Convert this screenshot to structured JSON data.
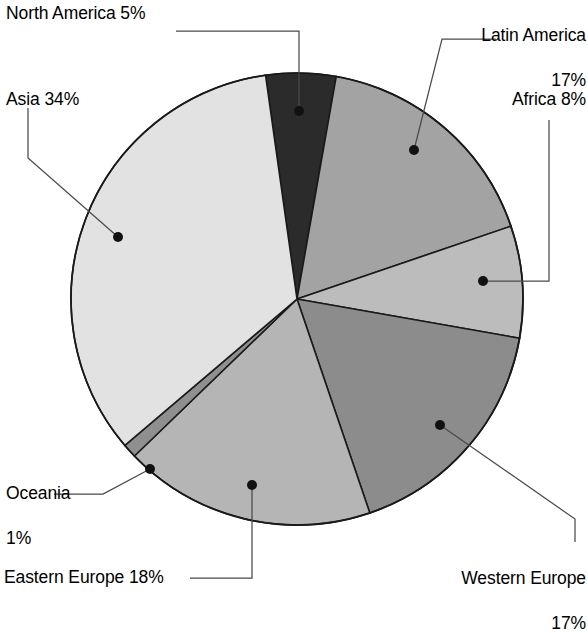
{
  "chart_data": {
    "type": "pie",
    "title": "",
    "subtitle": "",
    "xlabel": "",
    "ylabel": "",
    "legend_position": "none",
    "grid": false,
    "units": "%",
    "total": 100,
    "start_angle_deg": -8,
    "direction": "clockwise",
    "categories": [
      "North America",
      "Latin America",
      "Africa",
      "Western Europe",
      "Eastern Europe",
      "Oceania",
      "Asia"
    ],
    "values": [
      5,
      17,
      8,
      17,
      18,
      1,
      34
    ],
    "slices": [
      {
        "name": "North America",
        "value": 5,
        "label": "North America 5%",
        "value_label": "5%",
        "color": "#2b2b2b",
        "leader": "elbow-left"
      },
      {
        "name": "Latin America",
        "value": 17,
        "label": "Latin America 17%",
        "value_label": "17%",
        "color": "#a3a3a3",
        "leader": "diagonal-right"
      },
      {
        "name": "Africa",
        "value": 8,
        "label": "Africa 8%",
        "value_label": "8%",
        "color": "#bcbcbc",
        "leader": "elbow-right"
      },
      {
        "name": "Western Europe",
        "value": 17,
        "label": "Western Europe 17%",
        "value_label": "17%",
        "color": "#8c8c8c",
        "leader": "elbow-right-down"
      },
      {
        "name": "Eastern Europe",
        "value": 18,
        "label": "Eastern Europe 18%",
        "value_label": "18%",
        "color": "#b5b5b5",
        "leader": "elbow-left-down"
      },
      {
        "name": "Oceania",
        "value": 1,
        "label": "Oceania 1%",
        "value_label": "1%",
        "color": "#8f8f8f",
        "leader": "elbow-left"
      },
      {
        "name": "Asia",
        "value": 34,
        "label": "Asia 34%",
        "value_label": "34%",
        "color": "#e2e2e2",
        "leader": "elbow-left-up"
      }
    ]
  },
  "labels": {
    "north_america": "North America 5%",
    "asia": "Asia 34%",
    "latin_america_line1": "Latin America",
    "latin_america_line2": "17%",
    "africa": "Africa 8%",
    "western_europe_line1": "Western Europe",
    "western_europe_line2": "17%",
    "eastern_europe": "Eastern Europe 18%",
    "oceania_line1": "Oceania",
    "oceania_line2": "1%"
  },
  "style": {
    "background": "#ffffff",
    "outline": "#1a1a1a",
    "text": "#000000",
    "leader_line": "#4a4a4a",
    "marker": "#111111"
  }
}
